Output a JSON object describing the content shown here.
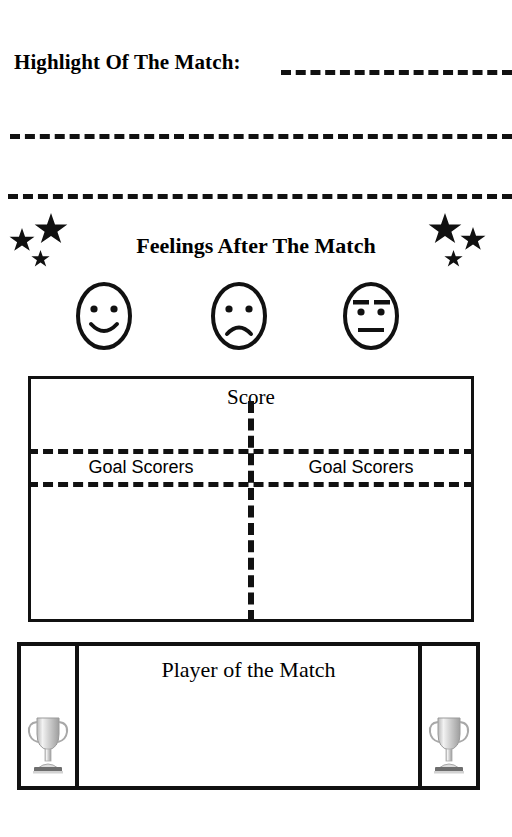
{
  "page": {
    "background_color": "#ffffff",
    "ink_color": "#111111"
  },
  "highlight": {
    "label": "Highlight Of The Match:",
    "writing_lines": [
      "",
      "",
      ""
    ],
    "line_style": "dashed"
  },
  "feelings": {
    "title": "Feelings After The Match",
    "faces": [
      {
        "name": "happy-face-icon",
        "mood": "happy"
      },
      {
        "name": "sad-face-icon",
        "mood": "sad"
      },
      {
        "name": "neutral-face-icon",
        "mood": "neutral"
      }
    ],
    "stars_left": [
      {
        "name": "star-icon",
        "size": "large"
      },
      {
        "name": "star-icon",
        "size": "medium"
      },
      {
        "name": "star-icon",
        "size": "small"
      }
    ],
    "stars_right": [
      {
        "name": "star-icon",
        "size": "large"
      },
      {
        "name": "star-icon",
        "size": "medium"
      },
      {
        "name": "star-icon",
        "size": "small"
      }
    ]
  },
  "score": {
    "title": "Score",
    "home_goal_scorers_label": "Goal Scorers",
    "away_goal_scorers_label": "Goal Scorers",
    "home_score_value": "",
    "away_score_value": "",
    "home_scorers_value": "",
    "away_scorers_value": ""
  },
  "player_of_the_match": {
    "title": "Player of the Match",
    "value": "",
    "trophy_left": "trophy-icon",
    "trophy_right": "trophy-icon"
  }
}
